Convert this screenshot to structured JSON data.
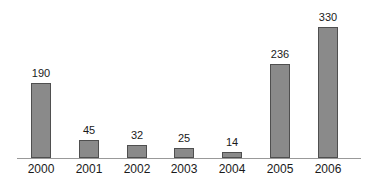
{
  "chart_data": {
    "type": "bar",
    "title": "",
    "xlabel": "",
    "ylabel": "",
    "categories": [
      "2000",
      "2001",
      "2002",
      "2003",
      "2004",
      "2005",
      "2006"
    ],
    "values": [
      190,
      45,
      32,
      25,
      14,
      236,
      330
    ],
    "ylim": [
      0,
      330
    ],
    "grid": false,
    "legend": false,
    "value_labels_shown": true,
    "colors": {
      "background": "#ffffff",
      "bar_fill": "#8a8a8a",
      "bar_border": "#4f4f4f",
      "axis_line": "#999999",
      "text": "#1a1a1a"
    }
  }
}
